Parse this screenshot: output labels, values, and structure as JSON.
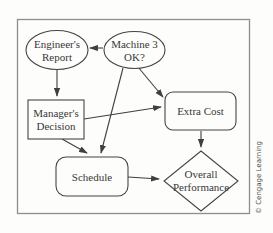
{
  "figure": {
    "type": "flowchart",
    "credit": "© Cengage Learning",
    "colors": {
      "line_stroke": "#3f3f3f",
      "shape_stroke": "#454545",
      "frame_border": "#8e8e8e",
      "label_text": "#383838",
      "credit_text": "#4a4a4a",
      "background": "#fdfdfc"
    },
    "nodes": {
      "engineers_report": {
        "shape": "ellipse",
        "line1": "Engineer's",
        "line2": "Report"
      },
      "machine3_ok": {
        "shape": "ellipse",
        "line1": "Machine 3",
        "line2": "OK?"
      },
      "managers_decision": {
        "shape": "rectangle",
        "line1": "Manager's",
        "line2": "Decision"
      },
      "extra_cost": {
        "shape": "rounded-rectangle",
        "label": "Extra Cost"
      },
      "schedule": {
        "shape": "rounded-rectangle",
        "label": "Schedule"
      },
      "overall_performance": {
        "shape": "diamond",
        "line1": "Overall",
        "line2": "Performance"
      }
    },
    "edges": [
      {
        "from": "machine3_ok",
        "to": "engineers_report"
      },
      {
        "from": "engineers_report",
        "to": "managers_decision"
      },
      {
        "from": "machine3_ok",
        "to": "extra_cost"
      },
      {
        "from": "machine3_ok",
        "to": "schedule"
      },
      {
        "from": "managers_decision",
        "to": "extra_cost"
      },
      {
        "from": "managers_decision",
        "to": "schedule"
      },
      {
        "from": "extra_cost",
        "to": "overall_performance"
      },
      {
        "from": "schedule",
        "to": "overall_performance"
      }
    ]
  }
}
